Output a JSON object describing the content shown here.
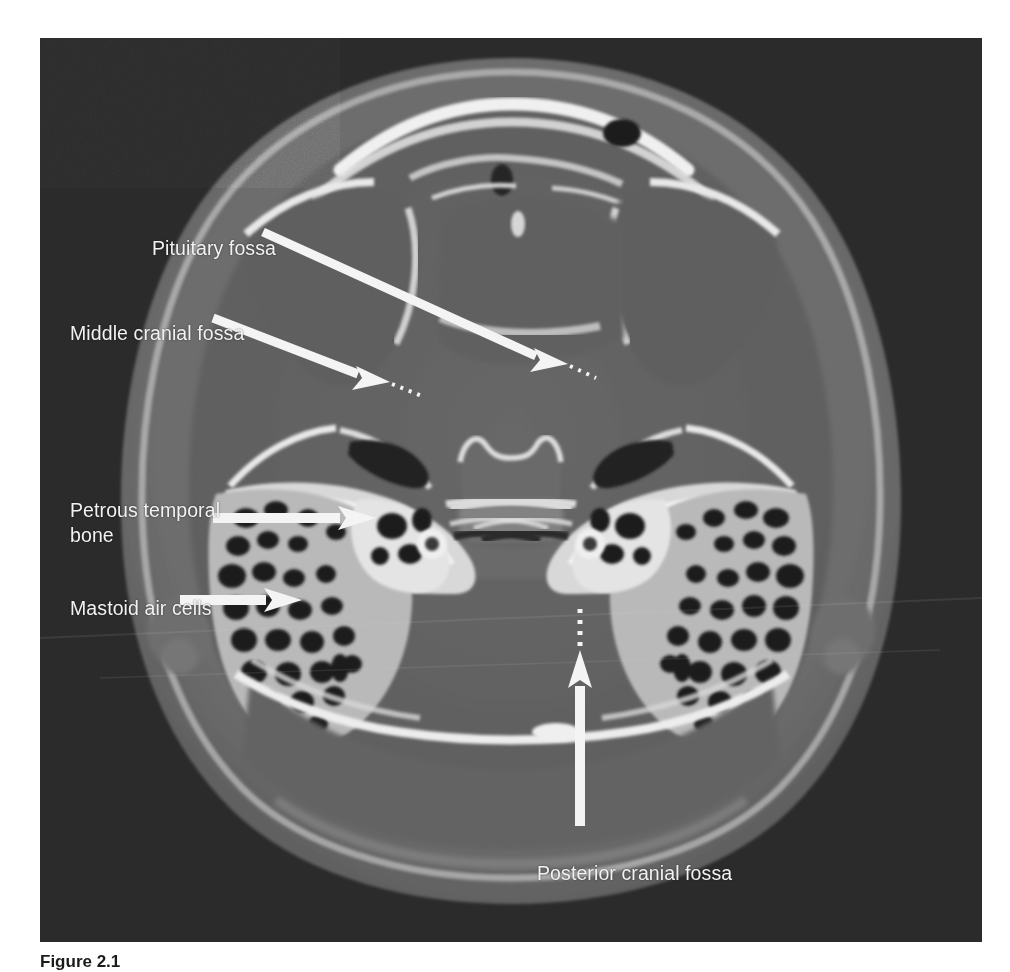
{
  "figure": {
    "kind": "medical-ct-scan",
    "modality": "CT",
    "plane": "axial",
    "region": "skull base",
    "panel": {
      "background_color": "#2b2b2b",
      "x": 40,
      "y": 38,
      "width": 942,
      "height": 904
    },
    "caption": {
      "number": "Figure 2.1",
      "text": "",
      "clipped": true
    }
  },
  "annotations": [
    {
      "id": "pituitary-fossa",
      "label": "Pituitary fossa",
      "label_x": 112,
      "label_y": 198,
      "arrow": {
        "type": "solid-arrow-with-dotted-extension",
        "from_x": 263,
        "from_y": 232,
        "to_x": 551,
        "to_y": 362,
        "color": "#f4f4f4"
      }
    },
    {
      "id": "middle-cranial-fossa",
      "label": "Middle cranial fossa",
      "label_x": 30,
      "label_y": 283,
      "arrow": {
        "type": "solid-arrow-with-dotted-extension",
        "from_x": 213,
        "from_y": 318,
        "to_x": 378,
        "to_y": 381,
        "color": "#f4f4f4"
      }
    },
    {
      "id": "petrous-temporal-bone",
      "label": "Petrous temporal\nbone",
      "label_x": 30,
      "label_y": 460,
      "arrow": {
        "type": "solid-arrow",
        "from_x": 213,
        "from_y": 518,
        "to_x": 365,
        "to_y": 518,
        "color": "#f4f4f4"
      }
    },
    {
      "id": "mastoid-air-cells",
      "label": "Mastoid air cells",
      "label_x": 30,
      "label_y": 558,
      "arrow": {
        "type": "solid-arrow",
        "from_x": 180,
        "from_y": 600,
        "to_x": 292,
        "to_y": 600,
        "color": "#f4f4f4"
      }
    },
    {
      "id": "posterior-cranial-fossa",
      "label": "Posterior cranial fossa",
      "label_x": 497,
      "label_y": 823,
      "arrow": {
        "type": "solid-arrow-with-dotted-extension",
        "from_x": 580,
        "from_y": 818,
        "to_x": 580,
        "to_y": 648,
        "color": "#f4f4f4"
      }
    }
  ],
  "colors": {
    "panel_background": "#2b2b2b",
    "label_text": "#f2f2f2",
    "arrow": "#f4f4f4",
    "soft_tissue": "#6f6f6f",
    "brain_parenchyma": "#646464",
    "bone_dense": "#ededed",
    "bone_mid": "#c9c9c9",
    "air": "#1e1e1e",
    "page_background": "#ffffff"
  }
}
